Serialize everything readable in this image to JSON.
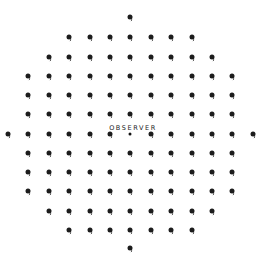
{
  "diagram": {
    "observer_label": "OBSERVER",
    "observer_label_pos": {
      "x": 133,
      "y": 124
    },
    "colors": {
      "dot": "#1c1c1c",
      "background": "#ffffff",
      "text": "#222222"
    },
    "grid": {
      "x0": 8,
      "dx": 20.4,
      "rows": [
        {
          "y": 17,
          "cols": [
            6
          ]
        },
        {
          "y": 37,
          "cols": [
            3,
            4,
            5,
            6,
            7,
            8,
            9
          ]
        },
        {
          "y": 57,
          "cols": [
            2,
            3,
            4,
            5,
            6,
            7,
            8,
            9,
            10
          ]
        },
        {
          "y": 76,
          "cols": [
            1,
            2,
            3,
            4,
            5,
            6,
            7,
            8,
            9,
            10,
            11
          ]
        },
        {
          "y": 95,
          "cols": [
            1,
            2,
            3,
            4,
            5,
            6,
            7,
            8,
            9,
            10,
            11
          ]
        },
        {
          "y": 114,
          "cols": [
            1,
            2,
            3,
            4,
            5,
            6,
            7,
            8,
            9,
            10,
            11
          ]
        },
        {
          "y": 134,
          "cols": [
            0,
            1,
            2,
            3,
            4,
            5,
            6,
            7,
            8,
            9,
            10,
            11,
            12
          ],
          "observer_col": 6
        },
        {
          "y": 153,
          "cols": [
            1,
            2,
            3,
            4,
            5,
            6,
            7,
            8,
            9,
            10,
            11
          ]
        },
        {
          "y": 172,
          "cols": [
            1,
            2,
            3,
            4,
            5,
            6,
            7,
            8,
            9,
            10,
            11
          ]
        },
        {
          "y": 191,
          "cols": [
            1,
            2,
            3,
            4,
            5,
            6,
            7,
            8,
            9,
            10,
            11
          ]
        },
        {
          "y": 211,
          "cols": [
            2,
            3,
            4,
            5,
            6,
            7,
            8,
            9,
            10
          ]
        },
        {
          "y": 230,
          "cols": [
            3,
            4,
            5,
            6,
            7,
            8,
            9
          ]
        },
        {
          "y": 248,
          "cols": [
            6
          ]
        }
      ]
    }
  }
}
